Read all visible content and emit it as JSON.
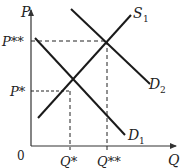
{
  "diagram": {
    "type": "supply-demand",
    "axes": {
      "y_label": "P",
      "x_label": "Q",
      "origin_label": "0"
    },
    "price_labels": {
      "p_star": "P*",
      "p_star_star": "P**"
    },
    "quantity_labels": {
      "q_star": "Q*",
      "q_star_star": "Q**"
    },
    "curves": [
      {
        "name": "S",
        "subscript": "1",
        "kind": "supply"
      },
      {
        "name": "D",
        "subscript": "2",
        "kind": "demand"
      },
      {
        "name": "D",
        "subscript": "1",
        "kind": "demand"
      }
    ],
    "equilibria": [
      {
        "curves": "S1 ∩ D1",
        "price": "P*",
        "quantity": "Q*"
      },
      {
        "curves": "S1 ∩ D2",
        "price": "P**",
        "quantity": "Q**"
      }
    ],
    "colors": {
      "line": "#1a1a1a",
      "axis": "#333333"
    }
  }
}
